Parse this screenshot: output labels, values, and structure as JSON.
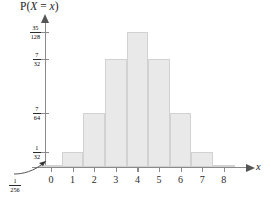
{
  "chart_data": {
    "type": "bar",
    "title": "P(X = x)",
    "xlabel": "x",
    "ylabel": "P(X = x)",
    "categories": [
      "0",
      "1",
      "2",
      "3",
      "4",
      "5",
      "6",
      "7",
      "8"
    ],
    "values": [
      0.00390625,
      0.03125,
      0.109375,
      0.21875,
      0.2734375,
      0.21875,
      0.109375,
      0.03125,
      0.00390625
    ],
    "value_labels": [
      "1/256",
      "1/32",
      "7/64",
      "7/32",
      "35/128",
      "7/32",
      "7/64",
      "1/32",
      "1/256"
    ],
    "ylim": [
      0,
      0.2734375
    ],
    "xlim": [
      -0.6,
      8.6
    ],
    "grid": false,
    "legend": false,
    "ytick_values": [
      0.2734375,
      0.21875,
      0.109375,
      0.03125
    ],
    "ytick_labels": [
      {
        "numerator": "35",
        "denominator": "128"
      },
      {
        "numerator": "7",
        "denominator": "32"
      },
      {
        "numerator": "7",
        "denominator": "64"
      },
      {
        "numerator": "1",
        "denominator": "32"
      }
    ],
    "annotation": {
      "label": {
        "numerator": "1",
        "denominator": "256"
      },
      "description": "curved arrow pointing to the very short bars at x=0 and x=8"
    },
    "bar_fill_color": "#e9e9e9",
    "bar_border_color": "#d2d2d2",
    "axis_color": "#8a8a8a",
    "text_color": "#1d1d1d"
  },
  "axis_titles": {
    "y_prefix": "P(",
    "y_var": "X",
    "y_eq": " = ",
    "y_var2": "x",
    "y_suffix": ")",
    "x": "x"
  }
}
